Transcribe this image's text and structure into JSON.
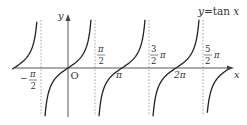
{
  "chart_data": {
    "type": "line",
    "function": "tan",
    "curve_label": "y=tan x",
    "xlabel": "x",
    "ylabel": "y",
    "origin_label": "O",
    "x_range_radians": [
      -1.03,
      2.95
    ],
    "x_range_note": "in multiples of pi",
    "asymptotes_pi": [
      -0.5,
      0.5,
      1.5,
      2.5
    ],
    "zeros_pi": [
      0,
      1,
      2
    ],
    "tick_labels": [
      {
        "value_pi": -0.5,
        "numerator": "π",
        "denominator": "2",
        "sign": "−",
        "position": "below"
      },
      {
        "value_pi": 0.5,
        "numerator": "π",
        "denominator": "2",
        "sign": "",
        "position": "above"
      },
      {
        "value_pi": 1,
        "text": "π",
        "position": "below"
      },
      {
        "value_pi": 1.5,
        "numerator": "3",
        "denominator": "2",
        "suffix": "π",
        "position": "above"
      },
      {
        "value_pi": 2,
        "text": "2π",
        "position": "below"
      },
      {
        "value_pi": 2.5,
        "numerator": "5",
        "denominator": "2",
        "suffix": "π",
        "position": "above"
      }
    ],
    "branches": [
      {
        "from_pi": -1.03,
        "to_pi": -0.56
      },
      {
        "from_pi": -0.46,
        "to_pi": 0.46
      },
      {
        "from_pi": 0.54,
        "to_pi": 1.46
      },
      {
        "from_pi": 1.54,
        "to_pi": 2.46
      },
      {
        "from_pi": 2.58,
        "to_pi": 2.95
      }
    ],
    "grid": false,
    "asymptote_style": "dotted",
    "line_color": "#222222",
    "axis_color": "#444444",
    "asymptote_color": "#888888"
  },
  "labels": {
    "y_axis": "y",
    "x_axis": "x",
    "origin": "O",
    "curve": "y=tan x",
    "neg_half_pi_sign": "−",
    "pi": "π",
    "two": "2",
    "three": "3",
    "five": "5",
    "two_pi": "2π"
  }
}
